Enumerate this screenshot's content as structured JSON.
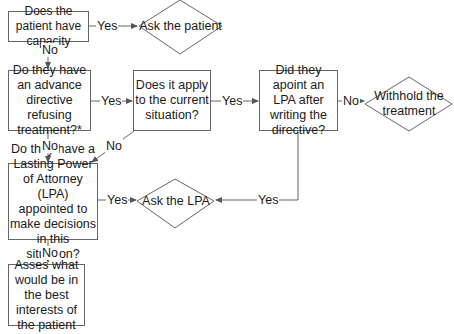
{
  "diagram": {
    "type": "flowchart",
    "nodes": {
      "capacity": "Does the patient have capacity",
      "ask_patient": "Ask the patient",
      "advance_directive": "Do they have an advance directive refusing treatment?*",
      "applies": "Does it apply to the current situation?",
      "lpa_after": "Did they apoint an LPA after writing the directive?",
      "withhold": "Withhold the treatment",
      "lasting_power": "Do they have a Lasting Power of Attorney (LPA) appointed to make decisions in this situation?",
      "ask_lpa": "Ask the LPA",
      "best_interests": "Asses what would be in the best interests of the patient"
    },
    "edges": {
      "capacity_yes": "Yes",
      "capacity_no": "No",
      "directive_yes": "Yes",
      "directive_no": "No",
      "applies_yes": "Yes",
      "applies_no": "No",
      "lpa_after_no": "No",
      "lpa_after_yes": "Yes",
      "lasting_yes": "Yes",
      "lasting_no": "No"
    },
    "line_color": "#666666"
  }
}
